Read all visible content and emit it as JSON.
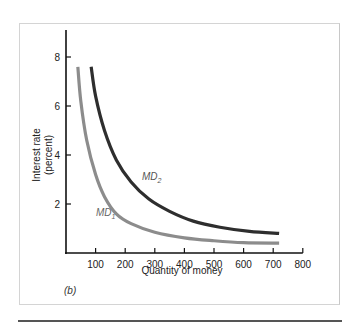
{
  "chart_data": {
    "type": "line",
    "title": "",
    "panel_label": "(b)",
    "xlabel": "Quantity of money",
    "ylabel_line1": "Interest rate",
    "ylabel_line2": "(percent)",
    "xlim": [
      0,
      800
    ],
    "ylim": [
      0,
      9
    ],
    "x_ticks": [
      100,
      200,
      300,
      400,
      500,
      600,
      700,
      800
    ],
    "y_ticks": [
      2,
      4,
      6,
      8
    ],
    "grid": false,
    "series": [
      {
        "name": "MD1",
        "label_main": "MD",
        "label_sub": "1",
        "color": "#8c8c8c",
        "points": [
          [
            40,
            7.6
          ],
          [
            50,
            6.2
          ],
          [
            70,
            4.6
          ],
          [
            100,
            3.2
          ],
          [
            130,
            2.3
          ],
          [
            170,
            1.6
          ],
          [
            220,
            1.2
          ],
          [
            300,
            0.85
          ],
          [
            400,
            0.62
          ],
          [
            500,
            0.5
          ],
          [
            600,
            0.42
          ],
          [
            720,
            0.4
          ]
        ]
      },
      {
        "name": "MD2",
        "label_main": "MD",
        "label_sub": "2",
        "color": "#2e2e2e",
        "points": [
          [
            85,
            7.6
          ],
          [
            100,
            6.4
          ],
          [
            130,
            5.0
          ],
          [
            170,
            3.8
          ],
          [
            220,
            2.9
          ],
          [
            280,
            2.2
          ],
          [
            350,
            1.7
          ],
          [
            430,
            1.3
          ],
          [
            520,
            1.05
          ],
          [
            620,
            0.88
          ],
          [
            720,
            0.8
          ]
        ]
      }
    ]
  }
}
